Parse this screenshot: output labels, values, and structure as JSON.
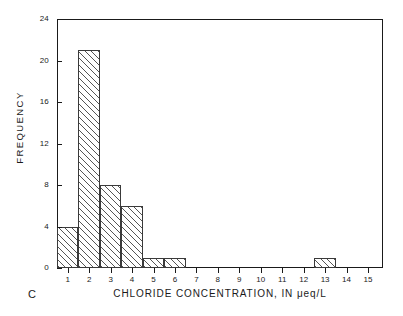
{
  "panel": {
    "label": "C"
  },
  "chart_data": {
    "type": "bar",
    "title": "",
    "subtitle": "",
    "xlabel": "CHLORIDE CONCENTRATION, IN μeq/L",
    "ylabel": "FREQUENCY",
    "categories": [
      "1",
      "2",
      "3",
      "4",
      "5",
      "6",
      "7",
      "8",
      "9",
      "10",
      "11",
      "12",
      "13",
      "14",
      "15"
    ],
    "values": [
      4,
      21,
      8,
      6,
      1,
      1,
      0,
      0,
      0,
      0,
      0,
      0,
      1,
      0,
      0
    ],
    "xlim": [
      0.5,
      15.7
    ],
    "ylim": [
      0,
      24
    ],
    "xticks": [
      "1",
      "2",
      "3",
      "4",
      "5",
      "6",
      "7",
      "8",
      "9",
      "10",
      "11",
      "12",
      "13",
      "14",
      "15"
    ],
    "yticks": [
      "0",
      "4",
      "8",
      "12",
      "16",
      "20",
      "24"
    ],
    "grid": false,
    "legend": false,
    "legend_position": "none",
    "bar_style": "diagonal-hatch",
    "bar_edge_color": "#3a3a3a",
    "axis_color": "#1a1a1a",
    "background_color": "#ffffff",
    "annotations": [
      "C"
    ]
  }
}
